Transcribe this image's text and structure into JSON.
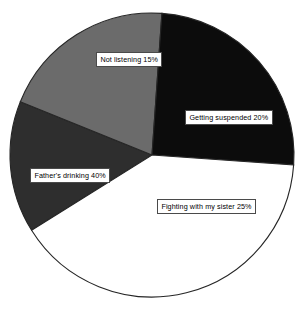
{
  "chart_data": {
    "type": "pie",
    "title": "",
    "subtitle": "",
    "xlabel": "",
    "ylabel": "",
    "grid": false,
    "legend": "none",
    "label_format": "{name} {value}%",
    "total": 100,
    "units": "percent",
    "geometry": {
      "center_x": 152,
      "center_y": 155,
      "radius": 142,
      "start_angle_deg": -122,
      "direction": "clockwise"
    },
    "categories": [
      "Not listening",
      "Getting suspended",
      "Fighting with my sister",
      "Father's drinking"
    ],
    "values": [
      15,
      20,
      25,
      40
    ],
    "colors": [
      "#2e2e2e",
      "#6b6b6b",
      "#0c0c0c",
      "#ffffff"
    ],
    "slices": [
      {
        "name": "Not listening",
        "value": 15,
        "label": "Not listening 15%",
        "color": "#2e2e2e",
        "start_angle_deg": -122,
        "end_angle_deg": -68
      },
      {
        "name": "Getting suspended",
        "value": 20,
        "label": "Getting suspended 20%",
        "color": "#6b6b6b",
        "start_angle_deg": -68,
        "end_angle_deg": 4
      },
      {
        "name": "Fighting with my sister",
        "value": 25,
        "label": "Fighting with my sister 25%",
        "color": "#0c0c0c",
        "start_angle_deg": 4,
        "end_angle_deg": 94
      },
      {
        "name": "Father's drinking",
        "value": 40,
        "label": "Father's drinking 40%",
        "color": "#ffffff",
        "start_angle_deg": 94,
        "end_angle_deg": 238
      }
    ],
    "outline_color": "#262626",
    "background": "#ffffff"
  }
}
